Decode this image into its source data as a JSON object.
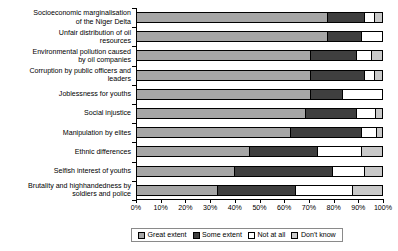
{
  "chart_data": {
    "type": "bar",
    "orientation": "horizontal",
    "stacked": true,
    "stack_mode": "percent",
    "title": "",
    "subtitle": "",
    "xlabel": "",
    "ylabel": "",
    "xlim": [
      0,
      100
    ],
    "grid": false,
    "legend_position": "bottom",
    "xticklabels": [
      "0%",
      "10%",
      "20%",
      "30%",
      "40%",
      "50%",
      "60%",
      "70%",
      "80%",
      "90%",
      "100%"
    ],
    "xticks": [
      0,
      10,
      20,
      30,
      40,
      50,
      60,
      70,
      80,
      90,
      100
    ],
    "categories": [
      "Socioeconomic marginalisation of the Niger Delta",
      "Unfair distribution of oil resources",
      "Environmental pollution caused by oil companies",
      "Corruption by public officers and leaders",
      "Joblessness for youths",
      "Social injustice",
      "Manipulation by elites",
      "Ethnic differences",
      "Selfish interest of youths",
      "Brutality and highhandedness by soldiers and police"
    ],
    "category_lines": [
      [
        "Socioeconomic marginalisation",
        "of the Niger Delta"
      ],
      [
        "Unfair distribution of oil",
        "resources"
      ],
      [
        "Environmental pollution caused",
        "by oil companies"
      ],
      [
        "Corruption by public officers and",
        "leaders"
      ],
      [
        "Joblessness for youths"
      ],
      [
        "Social injustice"
      ],
      [
        "Manipulation by elites"
      ],
      [
        "Ethnic differences"
      ],
      [
        "Selfish interest of youths"
      ],
      [
        "Brutality and highhandedness by",
        "soldiers and police"
      ]
    ],
    "series": [
      {
        "name": "Great extent",
        "color": "#a6a6a6",
        "values": [
          78,
          78,
          71,
          71,
          71,
          69,
          63,
          46,
          40,
          33
        ]
      },
      {
        "name": "Some extent",
        "color": "#3f3f3f",
        "values": [
          15,
          14,
          19,
          22,
          13,
          21,
          29,
          28,
          40,
          32
        ]
      },
      {
        "name": "Not at all",
        "color": "#ffffff",
        "values": [
          4,
          8,
          6,
          4,
          16,
          7.5,
          6,
          18,
          13,
          23
        ]
      },
      {
        "name": "Don't know",
        "color": "#c9c9c9",
        "values": [
          3,
          0,
          4,
          3,
          0,
          2.5,
          2,
          8,
          7,
          12
        ]
      }
    ]
  },
  "legend": {
    "items": [
      {
        "label": "Great extent",
        "key": "great"
      },
      {
        "label": "Some extent",
        "key": "some"
      },
      {
        "label": "Not at all",
        "key": "notat"
      },
      {
        "label": "Don't know",
        "key": "dk"
      }
    ]
  }
}
